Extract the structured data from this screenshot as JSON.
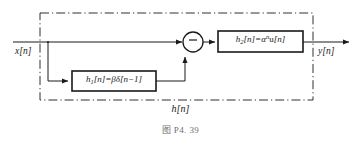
{
  "figure": {
    "caption": "图 P4. 39",
    "system_label": "h[n]",
    "input_label": "x[n]",
    "output_label": "y[n]",
    "background_color": "#ffffff",
    "line_color": "#1a1a1a",
    "caption_color": "#6f6f6f"
  },
  "diagram": {
    "type": "block-diagram",
    "blocks": [
      {
        "id": "h1",
        "name": "h1-block",
        "equation_plain": "h₁[n]=βδ[n−1]",
        "symbol": "h",
        "subscript": "1",
        "arg": "[n]",
        "equals": "=",
        "gain": "β",
        "impulse": "δ",
        "impulse_arg": "[n−1]"
      },
      {
        "id": "h2",
        "name": "h2-block",
        "equation_plain": "h₂[n]=αⁿu[n]",
        "symbol": "h",
        "subscript": "2",
        "arg": "[n]",
        "equals": "=",
        "base": "α",
        "exponent": "n",
        "step": "u",
        "step_arg": "[n]"
      }
    ],
    "summing_junction": {
      "name": "summing-junction",
      "sign": "−",
      "inputs": [
        "direct path from x[n]",
        "h1[n] branch"
      ],
      "output": "to h2[n]"
    },
    "boundary": {
      "style": "dash-dot",
      "label": "h[n]"
    }
  }
}
